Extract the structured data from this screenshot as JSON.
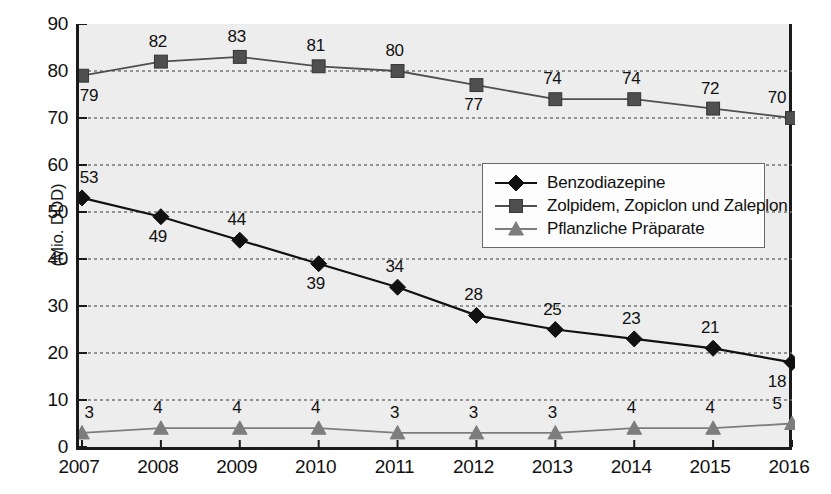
{
  "chart_data": {
    "type": "line",
    "title": "",
    "xlabel": "",
    "ylabel": "(Mio. DDD)",
    "ylim": [
      0,
      90
    ],
    "ytick_step": 10,
    "grid": true,
    "legend_position": "center-right",
    "categories": [
      "2007",
      "2008",
      "2009",
      "2010",
      "2011",
      "2012",
      "2013",
      "2014",
      "2015",
      "2016"
    ],
    "yticks": [
      "0",
      "10",
      "20",
      "30",
      "40",
      "50",
      "60",
      "70",
      "80",
      "90"
    ],
    "series": [
      {
        "name": "Benzodiazepine",
        "marker": "diamond",
        "color": "#111111",
        "values": [
          53,
          49,
          44,
          39,
          34,
          28,
          25,
          23,
          21,
          18
        ],
        "label_positions": [
          "above",
          "below",
          "above",
          "below",
          "above",
          "above",
          "above",
          "above",
          "above",
          "below"
        ]
      },
      {
        "name": "Zolpidem, Zopiclon und Zaleplon",
        "marker": "square",
        "color": "#4f4f4f",
        "values": [
          79,
          82,
          83,
          81,
          80,
          77,
          74,
          74,
          72,
          70
        ],
        "label_positions": [
          "below",
          "above",
          "above",
          "above",
          "above",
          "below",
          "above",
          "above",
          "above",
          "above"
        ]
      },
      {
        "name": "Pflanzliche Präparate",
        "marker": "triangle",
        "color": "#7d7d7d",
        "values": [
          3,
          4,
          4,
          4,
          3,
          3,
          3,
          4,
          4,
          5
        ],
        "label_positions": [
          "above",
          "above",
          "above",
          "above",
          "above",
          "above",
          "above",
          "above",
          "above",
          "above"
        ]
      }
    ]
  },
  "colors": {
    "plot_background": "#ededed",
    "axis": "#1a1a1a",
    "grid": "#767676",
    "page_background": "#ffffff"
  }
}
